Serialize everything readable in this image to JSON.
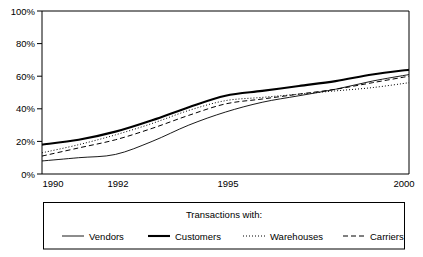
{
  "chart_data": {
    "type": "line",
    "title": "",
    "xlabel": "",
    "ylabel": "",
    "grid": false,
    "xlim": [
      1990,
      2000
    ],
    "ylim": [
      0,
      100
    ],
    "x_tick_labels": [
      "1990",
      "1992",
      "1995",
      "2000"
    ],
    "x_tick_values": [
      1990,
      1992,
      1995,
      2000
    ],
    "y_tick_labels": [
      "0%",
      "20%",
      "40%",
      "60%",
      "80%",
      "100%"
    ],
    "y_tick_values": [
      0,
      20,
      40,
      60,
      80,
      100
    ],
    "legend_position": "bottom",
    "legend_title": "Transactions with:",
    "x": [
      1990,
      1991,
      1992,
      1993,
      1994,
      1995,
      1996,
      1997,
      1998,
      1999,
      2000
    ],
    "series": [
      {
        "name": "Vendors",
        "style": "thin-solid",
        "values": [
          8,
          10,
          12,
          20,
          30,
          38,
          44,
          48,
          52,
          57,
          61
        ]
      },
      {
        "name": "Customers",
        "style": "thick-solid",
        "values": [
          18,
          21,
          26,
          33,
          41,
          48,
          51,
          54,
          57,
          61,
          64
        ]
      },
      {
        "name": "Warehouses",
        "style": "dotted",
        "values": [
          13,
          18,
          24,
          31,
          39,
          45,
          47,
          49,
          51,
          53,
          56
        ]
      },
      {
        "name": "Carriers",
        "style": "dashed",
        "values": [
          11,
          16,
          21,
          28,
          36,
          43,
          46,
          49,
          52,
          56,
          60
        ]
      }
    ]
  },
  "colors": {
    "axis": "#000000",
    "line": "#000000",
    "legend_border": "#000000",
    "background": "#ffffff"
  },
  "legend": {
    "title": "Transactions with:",
    "items": [
      {
        "label": "Vendors",
        "swatch": "thin-solid-swatch"
      },
      {
        "label": "Customers",
        "swatch": "thick-solid-swatch"
      },
      {
        "label": "Warehouses",
        "swatch": "dotted-swatch"
      },
      {
        "label": "Carriers",
        "swatch": "dashed-swatch"
      }
    ]
  },
  "axes": {
    "y_labels": [
      "100%",
      "80%",
      "60%",
      "40%",
      "20%",
      "0%"
    ],
    "x_labels": [
      "1990",
      "1992",
      "1995",
      "2000"
    ]
  }
}
